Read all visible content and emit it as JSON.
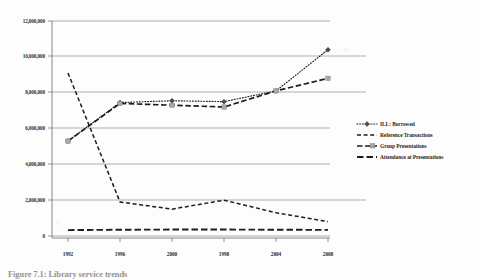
{
  "figure": {
    "caption": "Figure 7.1:  Library service trends",
    "background_color": "#fdfdfd",
    "ink_color": "#1c1c1c"
  },
  "chart_data": {
    "type": "line",
    "title": "",
    "subtitle": "",
    "xlabel": "",
    "ylabel": "",
    "grid": true,
    "legend_position": "right",
    "x": [
      "1992",
      "1996",
      "2000",
      "1998",
      "2004",
      "2008"
    ],
    "categories": [
      "1992",
      "1996",
      "2000",
      "1998",
      "2004",
      "2008"
    ],
    "xtick_labels": [
      "1992",
      "1996",
      "2000",
      "1998",
      "2004",
      "2008"
    ],
    "ytick_labels": [
      "12,000,000",
      "10,000,000",
      "8,000,000",
      "6,000,000",
      "4,000,000",
      "2,000,000",
      "0"
    ],
    "ytick_values": [
      12000000,
      10000000,
      8000000,
      6000000,
      4000000,
      2000000,
      0
    ],
    "ylim": [
      0,
      12000000
    ],
    "series": [
      {
        "name": "ILL: Borrowed",
        "line_style": "dotted",
        "marker": "diamond",
        "values": [
          5300000,
          7450000,
          7550000,
          7500000,
          8100000,
          10400000
        ]
      },
      {
        "name": "Reference Transactions",
        "line_style": "dashed",
        "marker": "none",
        "values": [
          9100000,
          1900000,
          1500000,
          2000000,
          1300000,
          800000
        ]
      },
      {
        "name": "Group Presentations",
        "line_style": "dashed-long",
        "marker": "square",
        "values": [
          5300000,
          7400000,
          7300000,
          7200000,
          8100000,
          8800000
        ]
      },
      {
        "name": "Attendance at Presentations",
        "line_style": "dash-dot",
        "marker": "none",
        "values": [
          330000,
          350000,
          360000,
          360000,
          350000,
          340000
        ]
      }
    ]
  },
  "legend": {
    "items": [
      {
        "label": "ILL: Borrowed",
        "style": "dotted-diamond"
      },
      {
        "label": "Reference Transactions",
        "style": "dashed"
      },
      {
        "label": "Group Presentations",
        "style": "dashed-square"
      },
      {
        "label": "Attendance at Presentations",
        "style": "dash-dot"
      }
    ]
  }
}
